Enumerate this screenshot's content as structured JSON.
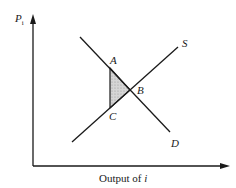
{
  "diagram": {
    "y_axis": {
      "label": "P",
      "subscript": "i"
    },
    "x_axis": {
      "label_prefix": "Output of ",
      "label_var": "i"
    },
    "curves": [
      {
        "name": "S",
        "label": "S"
      },
      {
        "name": "D",
        "label": "D"
      }
    ],
    "points": {
      "A": "A",
      "B": "B",
      "C": "C"
    },
    "shaded_region": {
      "vertices": [
        "A",
        "B",
        "C"
      ],
      "fill": "#c8c8c8"
    },
    "colors": {
      "line": "#1a1a1a",
      "background": "#ffffff"
    }
  }
}
